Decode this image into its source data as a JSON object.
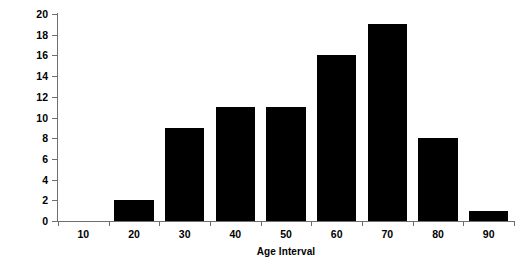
{
  "chart_data": {
    "type": "bar",
    "title": "",
    "xlabel": "Age Interval",
    "ylabel": "Number of Patients",
    "categories": [
      "10",
      "20",
      "30",
      "40",
      "50",
      "60",
      "70",
      "80",
      "90"
    ],
    "values": [
      0,
      2,
      9,
      11,
      11,
      16,
      19,
      8,
      1
    ],
    "ylim": [
      0,
      20
    ],
    "ytick_step": 2,
    "yticks": [
      "20",
      "18",
      "16",
      "14",
      "12",
      "10",
      "8",
      "6",
      "4",
      "2",
      "0"
    ],
    "grid": false,
    "legend": false,
    "bar_color": "#000000",
    "axis_color": "#6f6f6f",
    "background": "#ffffff"
  }
}
